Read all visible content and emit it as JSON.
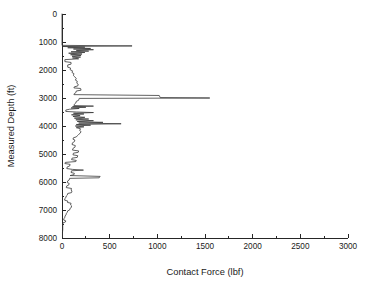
{
  "chart_data": {
    "type": "line",
    "title": "",
    "subtitle": "",
    "xlabel": "Contact Force (lbf)",
    "ylabel": "Measured Depth (ft)",
    "xlim": [
      0,
      3000
    ],
    "ylim": [
      0,
      8000
    ],
    "y_inverted": true,
    "grid": false,
    "legend": null,
    "x_ticks_major": [
      0,
      500,
      1000,
      1500,
      2000,
      2500,
      3000
    ],
    "x_ticks_minor": [
      250,
      750,
      1250,
      1750,
      2250,
      2750
    ],
    "y_ticks_major": [
      0,
      1000,
      2000,
      3000,
      4000,
      5000,
      6000,
      7000,
      8000
    ],
    "y_ticks_minor": [
      500,
      1500,
      2500,
      3500,
      4500,
      5500,
      6500,
      7500
    ],
    "x_tick_labels": [
      "0",
      "500",
      "1000",
      "1500",
      "2000",
      "2500",
      "3000"
    ],
    "y_tick_labels": [
      "0",
      "1000",
      "2000",
      "3000",
      "4000",
      "5000",
      "6000",
      "7000",
      "8000"
    ],
    "line_color": "#3a3a3a",
    "background_color": "#ffffff",
    "axis_color": "#262626",
    "series": [
      {
        "name": "Contact Force",
        "x_is_value": true,
        "points": [
          [
            0,
            0
          ],
          [
            0,
            1120
          ],
          [
            735,
            1140
          ],
          [
            10,
            1160
          ],
          [
            240,
            1185
          ],
          [
            60,
            1205
          ],
          [
            300,
            1230
          ],
          [
            120,
            1250
          ],
          [
            330,
            1275
          ],
          [
            150,
            1300
          ],
          [
            280,
            1325
          ],
          [
            95,
            1350
          ],
          [
            240,
            1375
          ],
          [
            70,
            1400
          ],
          [
            210,
            1430
          ],
          [
            90,
            1455
          ],
          [
            200,
            1480
          ],
          [
            105,
            1510
          ],
          [
            195,
            1540
          ],
          [
            110,
            1570
          ],
          [
            175,
            1600
          ],
          [
            30,
            1630
          ],
          [
            30,
            1700
          ],
          [
            95,
            1730
          ],
          [
            95,
            1790
          ],
          [
            60,
            1820
          ],
          [
            60,
            1900
          ],
          [
            90,
            1930
          ],
          [
            85,
            1990
          ],
          [
            110,
            2030
          ],
          [
            105,
            2090
          ],
          [
            125,
            2130
          ],
          [
            120,
            2200
          ],
          [
            135,
            2250
          ],
          [
            150,
            2300
          ],
          [
            140,
            2360
          ],
          [
            160,
            2400
          ],
          [
            155,
            2470
          ],
          [
            170,
            2510
          ],
          [
            165,
            2570
          ],
          [
            130,
            2600
          ],
          [
            125,
            2640
          ],
          [
            195,
            2660
          ],
          [
            200,
            2720
          ],
          [
            150,
            2750
          ],
          [
            145,
            2810
          ],
          [
            130,
            2840
          ],
          [
            125,
            2880
          ],
          [
            1020,
            2910
          ],
          [
            1030,
            2985
          ],
          [
            1550,
            3000
          ],
          [
            180,
            3015
          ],
          [
            175,
            3080
          ],
          [
            150,
            3120
          ],
          [
            145,
            3180
          ],
          [
            130,
            3220
          ],
          [
            125,
            3270
          ],
          [
            330,
            3290
          ],
          [
            110,
            3310
          ],
          [
            250,
            3330
          ],
          [
            95,
            3355
          ],
          [
            180,
            3375
          ],
          [
            80,
            3400
          ],
          [
            40,
            3430
          ],
          [
            40,
            3480
          ],
          [
            150,
            3500
          ],
          [
            330,
            3520
          ],
          [
            120,
            3545
          ],
          [
            230,
            3570
          ],
          [
            100,
            3600
          ],
          [
            190,
            3630
          ],
          [
            115,
            3660
          ],
          [
            240,
            3690
          ],
          [
            130,
            3720
          ],
          [
            280,
            3750
          ],
          [
            145,
            3780
          ],
          [
            330,
            3810
          ],
          [
            160,
            3840
          ],
          [
            430,
            3870
          ],
          [
            175,
            3895
          ],
          [
            620,
            3920
          ],
          [
            150,
            3945
          ],
          [
            300,
            3970
          ],
          [
            140,
            4000
          ],
          [
            230,
            4030
          ],
          [
            150,
            4060
          ],
          [
            195,
            4100
          ],
          [
            185,
            4160
          ],
          [
            200,
            4200
          ],
          [
            190,
            4260
          ],
          [
            175,
            4300
          ],
          [
            160,
            4350
          ],
          [
            150,
            4390
          ],
          [
            120,
            4420
          ],
          [
            115,
            4470
          ],
          [
            135,
            4500
          ],
          [
            130,
            4560
          ],
          [
            110,
            4600
          ],
          [
            105,
            4660
          ],
          [
            140,
            4700
          ],
          [
            135,
            4760
          ],
          [
            115,
            4800
          ],
          [
            110,
            4860
          ],
          [
            175,
            4890
          ],
          [
            170,
            4940
          ],
          [
            120,
            4970
          ],
          [
            115,
            5030
          ],
          [
            165,
            5060
          ],
          [
            160,
            5120
          ],
          [
            105,
            5150
          ],
          [
            100,
            5200
          ],
          [
            150,
            5230
          ],
          [
            145,
            5270
          ],
          [
            35,
            5300
          ],
          [
            30,
            5340
          ],
          [
            85,
            5370
          ],
          [
            80,
            5430
          ],
          [
            55,
            5460
          ],
          [
            50,
            5520
          ],
          [
            110,
            5550
          ],
          [
            225,
            5575
          ],
          [
            100,
            5600
          ],
          [
            95,
            5660
          ],
          [
            130,
            5690
          ],
          [
            125,
            5740
          ],
          [
            85,
            5770
          ],
          [
            400,
            5800
          ],
          [
            390,
            5850
          ],
          [
            80,
            5870
          ],
          [
            75,
            5930
          ],
          [
            60,
            5960
          ],
          [
            55,
            6020
          ],
          [
            75,
            6050
          ],
          [
            70,
            6110
          ],
          [
            50,
            6140
          ],
          [
            45,
            6200
          ],
          [
            100,
            6230
          ],
          [
            95,
            6290
          ],
          [
            105,
            6320
          ],
          [
            100,
            6380
          ],
          [
            60,
            6410
          ],
          [
            55,
            6470
          ],
          [
            45,
            6500
          ],
          [
            40,
            6560
          ],
          [
            30,
            6590
          ],
          [
            28,
            6650
          ],
          [
            60,
            6680
          ],
          [
            58,
            6730
          ],
          [
            95,
            6760
          ],
          [
            90,
            6820
          ],
          [
            100,
            6850
          ],
          [
            98,
            6910
          ],
          [
            85,
            6940
          ],
          [
            80,
            7000
          ],
          [
            60,
            7030
          ],
          [
            55,
            7090
          ],
          [
            45,
            7120
          ],
          [
            42,
            7180
          ],
          [
            32,
            7210
          ],
          [
            30,
            7270
          ],
          [
            20,
            7300
          ],
          [
            18,
            7360
          ],
          [
            40,
            7390
          ],
          [
            35,
            7430
          ],
          [
            10,
            7460
          ],
          [
            8,
            7520
          ],
          [
            8,
            7700
          ],
          [
            5,
            7800
          ],
          [
            5,
            7960
          ]
        ]
      }
    ]
  },
  "figure": {
    "width": 369,
    "height": 286
  }
}
